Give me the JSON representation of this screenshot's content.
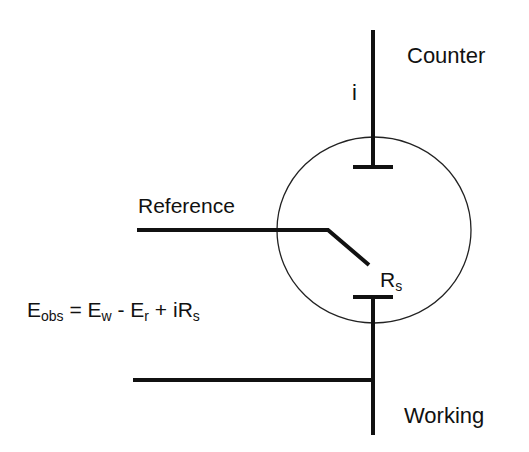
{
  "diagram": {
    "labels": {
      "counter": "Counter",
      "reference": "Reference",
      "working": "Working",
      "current": "i",
      "resistance_main": "R",
      "resistance_sub": "s"
    },
    "equation": {
      "E1": "E",
      "E1_sub": "obs",
      "eq": " = ",
      "E2": "E",
      "E2_sub": "w",
      "minus": " - ",
      "E3": "E",
      "E3_sub": "r",
      "plus": " + iR",
      "last_sub": "s"
    },
    "colors": {
      "line": "#111111",
      "background": "#ffffff"
    }
  }
}
